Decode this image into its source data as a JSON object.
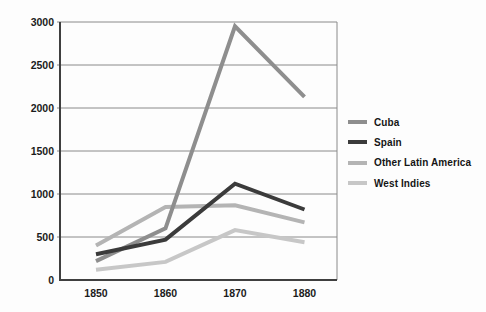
{
  "chart_data": {
    "type": "line",
    "title": "",
    "xlabel": "",
    "ylabel": "",
    "x": [
      1850,
      1860,
      1870,
      1880
    ],
    "x_tick_labels": [
      "1850",
      "1860",
      "1870",
      "1880"
    ],
    "ylim": [
      0,
      3000
    ],
    "ytick_step": 500,
    "y_tick_labels": [
      "0",
      "500",
      "1000",
      "1500",
      "2000",
      "2500",
      "3000"
    ],
    "grid": true,
    "legend_position": "right",
    "series": [
      {
        "name": "Cuba",
        "color": "#8e8e8e",
        "values": [
          220,
          600,
          2950,
          2130
        ]
      },
      {
        "name": "Spain",
        "color": "#3b3b3b",
        "values": [
          300,
          470,
          1120,
          820
        ]
      },
      {
        "name": "Other Latin America",
        "color": "#b4b4b4",
        "values": [
          400,
          850,
          870,
          670
        ]
      },
      {
        "name": "West Indies",
        "color": "#c7c7c7",
        "values": [
          120,
          210,
          580,
          440
        ]
      }
    ],
    "z_order_bottom_to_top": [
      "West Indies",
      "Other Latin America",
      "Cuba",
      "Spain"
    ]
  },
  "styles": {
    "background": "#fdfdfd",
    "grid_color": "#8a8a8a",
    "axis_color": "#3f3f3f",
    "label_color": "#1b1b1b"
  }
}
